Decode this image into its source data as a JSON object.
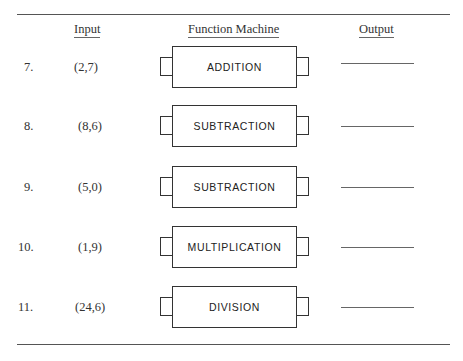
{
  "headers": {
    "input": "Input",
    "function_machine": "Function Machine",
    "output": "Output"
  },
  "rows": [
    {
      "number": "7.",
      "input": "(2,7)",
      "function": "ADDITION",
      "output": ""
    },
    {
      "number": "8.",
      "input": "(8,6)",
      "function": "SUBTRACTION",
      "output": ""
    },
    {
      "number": "9.",
      "input": "(5,0)",
      "function": "SUBTRACTION",
      "output": ""
    },
    {
      "number": "10.",
      "input": "(1,9)",
      "function": "MULTIPLICATION",
      "output": ""
    },
    {
      "number": "11.",
      "input": "(24,6)",
      "function": "DIVISION",
      "output": ""
    }
  ]
}
